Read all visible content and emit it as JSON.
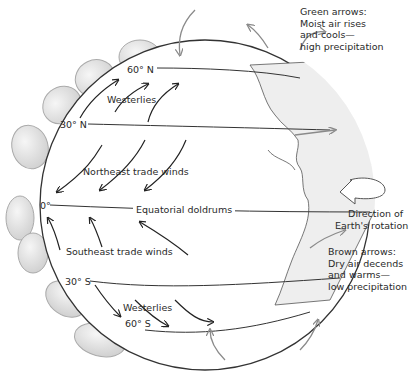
{
  "diagram": {
    "latitudes": [
      {
        "label": "60° N"
      },
      {
        "label": "30° N"
      },
      {
        "label": "0°"
      },
      {
        "label": "30° S"
      },
      {
        "label": "60° S"
      }
    ],
    "wind_belts": {
      "westerlies_north": "Westerlies",
      "ne_trades": "Northeast trade winds",
      "doldrums": "Equatorial doldrums",
      "se_trades": "Southeast trade winds",
      "westerlies_south": "Westerlies"
    },
    "notes": {
      "green": [
        "Green arrows:",
        "Moist air rises",
        "and cools—",
        "high precipitation"
      ],
      "rotation": [
        "Direction of",
        "Earth's rotation"
      ],
      "brown": [
        "Brown arrows:",
        "Dry air decends",
        "and warms—",
        "low precipitation"
      ]
    },
    "colors": {
      "globe_fill": "#ffffff",
      "globe_stroke": "#3a3a3a",
      "cell_fill": "#e4e4e4",
      "cell_stroke": "#9a9a9a",
      "arrow": "#222222",
      "gray_arrow": "#8a8a8a",
      "land_fill": "#ececec"
    }
  }
}
